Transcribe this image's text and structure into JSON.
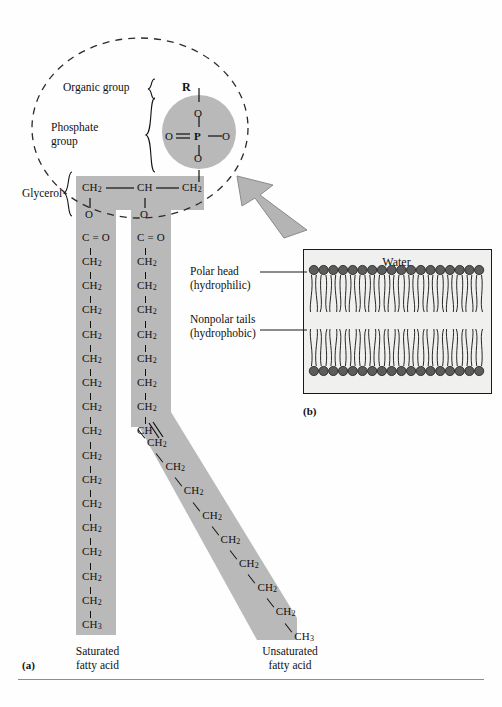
{
  "figure": {
    "panel_a_tag": "(a)",
    "panel_b_tag": "(b)",
    "bottom_rule": true
  },
  "head_group": {
    "dashed_circle": true,
    "r_label": "R",
    "phosphorus": "P",
    "oxygen_top": "O",
    "oxygen_left": "O",
    "oxygen_right": "O",
    "oxygen_bottom": "O",
    "double_bond_side": "left"
  },
  "bracket_labels": [
    {
      "id": "organic-group",
      "text": "Organic group"
    },
    {
      "id": "phosphate-group",
      "line1": "Phosphate",
      "line2": "group"
    },
    {
      "id": "glycerol",
      "text": "Glycerol"
    }
  ],
  "glycerol_backbone": {
    "c1": "CH",
    "c1_sub": "2",
    "c2": "CH",
    "c3": "CH",
    "c3_sub": "2",
    "o_left": "O",
    "o_right": "O",
    "ester_left": "C = O",
    "ester_right": "C = O"
  },
  "saturated_chain": {
    "name": "Saturated fatty acid",
    "caption_line1": "Saturated",
    "caption_line2": "fatty acid",
    "ester": "C = O",
    "repeat_unit": "CH",
    "repeat_sub": "2",
    "repeat_count": 15,
    "terminal": "CH",
    "terminal_sub": "3"
  },
  "unsaturated_chain": {
    "name": "Unsaturated fatty acid",
    "caption_line1": "Unsaturated",
    "caption_line2": "fatty acid",
    "ester": "C = O",
    "repeat_unit": "CH",
    "repeat_sub": "2",
    "vertical_count": 7,
    "double_bond_unit": "CH",
    "double_bond_note": "cis double bond causes kink",
    "diagonal_count": 8,
    "terminal": "CH",
    "terminal_sub": "3"
  },
  "bilayer": {
    "water_label": "Water",
    "head_count": 18,
    "polar_head_label_line1": "Polar head",
    "polar_head_label_line2": "(hydrophilic)",
    "nonpolar_tail_label_line1": "Nonpolar tails",
    "nonpolar_tail_label_line2": "(hydrophobic)"
  },
  "arrow": {
    "name": "zoom-out-arrow",
    "direction": "up-left"
  },
  "colors": {
    "band_gray": "#b9b9b9",
    "head_circle": "#5c5c5c",
    "water_fill": "#f0f0ee",
    "ink": "#111111",
    "rule": "#8d8d8d"
  }
}
